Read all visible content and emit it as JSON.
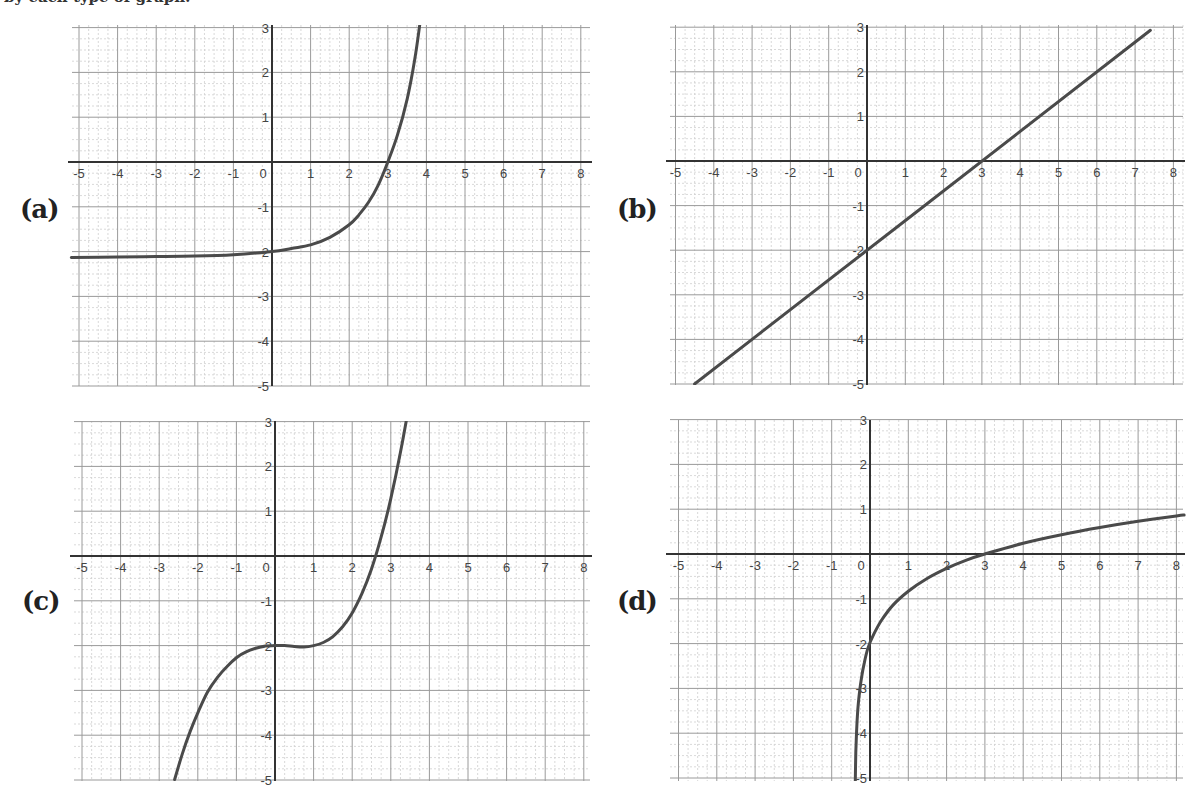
{
  "page": {
    "clipped_caption": "by each type of graph:"
  },
  "panels": [
    {
      "label": "(a)",
      "label_pos": [
        20,
        222
      ]
    },
    {
      "label": "(b)",
      "label_pos": [
        617,
        222
      ]
    },
    {
      "label": "(c)",
      "label_pos": [
        22,
        614
      ]
    },
    {
      "label": "(d)",
      "label_pos": [
        617,
        614
      ]
    }
  ],
  "colors": {
    "curve": "#4a4a4a",
    "axis": "#333333",
    "major_grid": "#9a9a9a",
    "minor_grid": "#cfcfcf",
    "tick_text": "#444444",
    "background": "#ffffff"
  },
  "chart_data": [
    {
      "id": "a",
      "type": "line",
      "title": "(a)",
      "description": "Exponential growth with horizontal asymptote y = -2, passing through (0,-2) and (3,0)",
      "xlabel": "",
      "ylabel": "",
      "xlim": [
        -5.2,
        8.2
      ],
      "ylim": [
        -5.2,
        3.2
      ],
      "x_ticks": [
        -5,
        -4,
        -3,
        -2,
        -1,
        0,
        1,
        2,
        3,
        4,
        5,
        6,
        7,
        8
      ],
      "y_ticks": [
        3,
        2,
        1,
        -1,
        -2,
        -3,
        -4,
        -5
      ],
      "grid": true,
      "minor_divisions": 4,
      "x": [
        -5.2,
        -4,
        -3,
        -2,
        -1,
        0,
        0.5,
        1,
        1.5,
        2,
        2.25,
        2.5,
        2.75,
        3,
        3.25,
        3.5,
        3.7,
        3.85
      ],
      "y": [
        -2.13,
        -2.12,
        -2.11,
        -2.1,
        -2.07,
        -2.0,
        -1.93,
        -1.85,
        -1.68,
        -1.4,
        -1.18,
        -0.9,
        -0.52,
        0.0,
        0.6,
        1.4,
        2.3,
        3.2
      ]
    },
    {
      "id": "b",
      "type": "line",
      "title": "(b)",
      "description": "Linear function y = (2/3)x - 2, passing through (0,-2) and (3,0)",
      "xlabel": "",
      "ylabel": "",
      "xlim": [
        -5.2,
        8.2
      ],
      "ylim": [
        -5.2,
        3.2
      ],
      "x_ticks": [
        -5,
        -4,
        -3,
        -2,
        -1,
        0,
        1,
        2,
        3,
        4,
        5,
        6,
        7,
        8
      ],
      "y_ticks": [
        3,
        2,
        1,
        -1,
        -2,
        -3,
        -4,
        -5
      ],
      "grid": true,
      "minor_divisions": 4,
      "x": [
        -4.5,
        7.4
      ],
      "y": [
        -5.0,
        2.93
      ]
    },
    {
      "id": "c",
      "type": "line",
      "title": "(c)",
      "description": "Cubic-shaped curve, flat near y = -2 for x in [0,1], passing through (0,-2) and (3,0)",
      "xlabel": "",
      "ylabel": "",
      "xlim": [
        -5.2,
        8.2
      ],
      "ylim": [
        -5.2,
        3.2
      ],
      "x_ticks": [
        -5,
        -4,
        -3,
        -2,
        -1,
        0,
        1,
        2,
        3,
        4,
        5,
        6,
        7,
        8
      ],
      "y_ticks": [
        3,
        2,
        1,
        -1,
        -2,
        -3,
        -4,
        -5
      ],
      "grid": true,
      "minor_divisions": 4,
      "x": [
        -2.6,
        -2.4,
        -2.2,
        -2.0,
        -1.75,
        -1.5,
        -1.25,
        -1.0,
        -0.75,
        -0.5,
        -0.25,
        0,
        0.25,
        0.5,
        0.75,
        1.0,
        1.25,
        1.5,
        1.75,
        2.0,
        2.25,
        2.5,
        2.75,
        3.0,
        3.25,
        3.5,
        3.7,
        3.9
      ],
      "y": [
        -4.99,
        -4.41,
        -3.92,
        -3.5,
        -3.04,
        -2.72,
        -2.47,
        -2.27,
        -2.14,
        -2.06,
        -2.01,
        -2.0,
        -2.0,
        -2.02,
        -2.03,
        -2.0,
        -1.93,
        -1.8,
        -1.58,
        -1.27,
        -0.84,
        -0.29,
        0.42,
        1.28,
        2.31,
        3.51,
        4.58,
        5.78
      ]
    },
    {
      "id": "d",
      "type": "line",
      "title": "(d)",
      "description": "Logarithmic curve with vertical asymptote near x = -0.4, passing through (0,-2) and (3,0)",
      "xlabel": "",
      "ylabel": "",
      "xlim": [
        -5.2,
        8.2
      ],
      "ylim": [
        -5.2,
        3.2
      ],
      "x_ticks": [
        -5,
        -4,
        -3,
        -2,
        -1,
        0,
        1,
        2,
        3,
        4,
        5,
        6,
        7,
        8
      ],
      "y_ticks": [
        3,
        2,
        1,
        -1,
        -2,
        -3,
        -4,
        -5
      ],
      "grid": true,
      "minor_divisions": 4,
      "x": [
        -0.385,
        -0.37,
        -0.35,
        -0.32,
        -0.28,
        -0.22,
        -0.15,
        -0.05,
        0.1,
        0.3,
        0.6,
        1.0,
        1.5,
        2.0,
        2.5,
        3.0,
        4.0,
        5.0,
        6.0,
        7.0,
        8.0,
        8.2
      ],
      "y": [
        -5.07,
        -4.43,
        -3.95,
        -3.5,
        -3.13,
        -2.75,
        -2.43,
        -2.09,
        -1.79,
        -1.48,
        -1.14,
        -0.83,
        -0.54,
        -0.32,
        -0.14,
        0.0,
        0.24,
        0.43,
        0.59,
        0.73,
        0.85,
        0.87
      ]
    }
  ],
  "layout": {
    "plots": [
      {
        "ox": 272,
        "oy": 162,
        "ux": 38.6,
        "uy": 44.8,
        "left": 72,
        "right": 590,
        "top": 25,
        "bottom": 386
      },
      {
        "ox": 867,
        "oy": 161,
        "ux": 38.3,
        "uy": 44.6,
        "left": 670,
        "right": 1183,
        "top": 25,
        "bottom": 385
      },
      {
        "ox": 275,
        "oy": 556,
        "ux": 38.6,
        "uy": 44.8,
        "left": 74,
        "right": 590,
        "top": 421,
        "bottom": 781
      },
      {
        "ox": 870,
        "oy": 554,
        "ux": 38.3,
        "uy": 44.8,
        "left": 670,
        "right": 1183,
        "top": 420,
        "bottom": 781
      }
    ]
  }
}
